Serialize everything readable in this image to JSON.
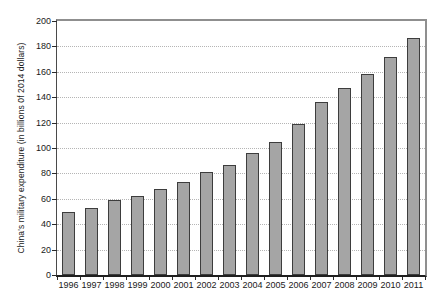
{
  "chart_data": {
    "type": "bar",
    "title": "",
    "ylabel": "China's military expenditure (in billions 0f 2014 dollars)",
    "xlabel": "",
    "categories": [
      "1996",
      "1997",
      "1998",
      "1999",
      "2000",
      "2001",
      "2002",
      "2003",
      "2004",
      "2005",
      "2006",
      "2007",
      "2008",
      "2009",
      "2010",
      "2011"
    ],
    "values": [
      50,
      53,
      59,
      62,
      68,
      73,
      81,
      87,
      96,
      105,
      119,
      136,
      147,
      158,
      172,
      187
    ],
    "ylim": [
      0,
      200
    ],
    "yticks": [
      0,
      20,
      40,
      60,
      80,
      100,
      120,
      140,
      160,
      180,
      200
    ],
    "grid": "horizontal-dotted",
    "legend": "none",
    "colors": {
      "background": "#ffffff",
      "bar_fill": "#a5a5a5",
      "bar_border": "#3d3d3d",
      "gridline": "#b5b5b5",
      "frame": "#8f8f8f",
      "axis_left": "#4a4a4a",
      "axis_bottom": "#1f1f1f",
      "tick": "#2a2a2a",
      "text": "#1a1a1a"
    }
  }
}
